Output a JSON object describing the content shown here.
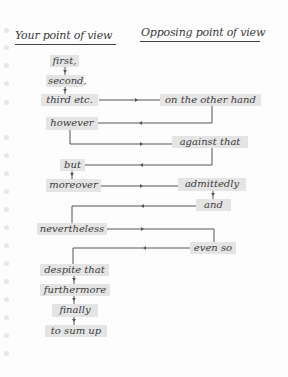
{
  "headers": {
    "left": "Your point of view",
    "right": "Opposing point of view"
  },
  "phrases": {
    "first": "first,",
    "second": "second,",
    "third": "third etc.",
    "other_hand": "on the other hand",
    "however": "however",
    "against": "against that",
    "but": "but",
    "moreover": "moreover",
    "admittedly": "admittedly",
    "and": "and",
    "nevertheless": "nevertheless",
    "even_so": "even so",
    "despite": "despite that",
    "furthermore": "furthermore",
    "finally": "finally",
    "sum_up": "to sum up"
  },
  "colors": {
    "box_fill": "#e4e4e4",
    "line": "#555555",
    "text": "#3b3b3b"
  }
}
